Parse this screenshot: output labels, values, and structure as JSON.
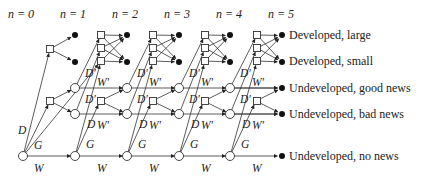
{
  "diagram": {
    "stage_headers": [
      "n = 0",
      "n = 1",
      "n = 2",
      "n = 3",
      "n = 4",
      "n = 5"
    ],
    "edge_labels": {
      "develop": "D",
      "develop_prime": "D′",
      "wait": "W",
      "wait_prime": "W′",
      "gather": "G"
    },
    "outcomes": [
      "Developed, large",
      "Developed, small",
      "Undeveloped, good news",
      "Undeveloped, bad news",
      "Undeveloped, no news"
    ],
    "node_types": {
      "decision": "square",
      "undeveloped_state": "open-circle",
      "terminal": "filled-dot"
    },
    "colors": {
      "line": "#333333",
      "text": "#222222",
      "background": "#ffffff"
    }
  }
}
